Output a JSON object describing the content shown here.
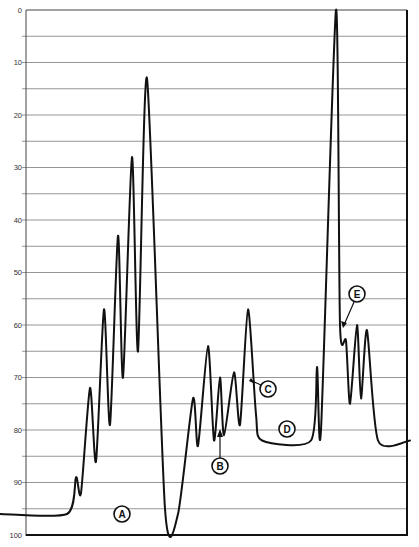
{
  "chart_data": {
    "type": "line",
    "title": "",
    "xlabel": "",
    "ylabel": "",
    "ylim": [
      0,
      100
    ],
    "y_inverted": true,
    "grid": true,
    "grid_step": 5,
    "y_ticks": [
      "0",
      "10",
      "20",
      "30",
      "40",
      "50",
      "60",
      "70",
      "80",
      "90",
      "100"
    ],
    "series": [
      {
        "name": "trace",
        "color": "#111111",
        "points": [
          {
            "x": 0,
            "y": 96
          },
          {
            "x": 67,
            "y": 96
          },
          {
            "x": 76,
            "y": 89
          },
          {
            "x": 81,
            "y": 92
          },
          {
            "x": 90,
            "y": 72
          },
          {
            "x": 96,
            "y": 86
          },
          {
            "x": 104,
            "y": 57
          },
          {
            "x": 110,
            "y": 79
          },
          {
            "x": 118,
            "y": 43
          },
          {
            "x": 123,
            "y": 70
          },
          {
            "x": 132,
            "y": 28
          },
          {
            "x": 138,
            "y": 65
          },
          {
            "x": 147,
            "y": 13
          },
          {
            "x": 165,
            "y": 95
          },
          {
            "x": 178,
            "y": 96
          },
          {
            "x": 193,
            "y": 74
          },
          {
            "x": 198,
            "y": 83
          },
          {
            "x": 208,
            "y": 64
          },
          {
            "x": 214,
            "y": 82
          },
          {
            "x": 220,
            "y": 70
          },
          {
            "x": 224,
            "y": 81
          },
          {
            "x": 234,
            "y": 69
          },
          {
            "x": 240,
            "y": 79
          },
          {
            "x": 248,
            "y": 57
          },
          {
            "x": 256,
            "y": 77
          },
          {
            "x": 262,
            "y": 82
          },
          {
            "x": 311,
            "y": 82
          },
          {
            "x": 317,
            "y": 68
          },
          {
            "x": 321,
            "y": 80
          },
          {
            "x": 336,
            "y": 0
          },
          {
            "x": 340,
            "y": 60
          },
          {
            "x": 346,
            "y": 63
          },
          {
            "x": 350,
            "y": 75
          },
          {
            "x": 357,
            "y": 60
          },
          {
            "x": 361,
            "y": 74
          },
          {
            "x": 367,
            "y": 61
          },
          {
            "x": 378,
            "y": 82
          },
          {
            "x": 410,
            "y": 82
          }
        ]
      }
    ],
    "annotations": [
      {
        "label": "A",
        "x": 122,
        "y": 96
      },
      {
        "label": "B",
        "x": 220,
        "y": 88,
        "arrow_to_y": 80
      },
      {
        "label": "C",
        "x": 268,
        "y": 73,
        "arrow_to_y": 71
      },
      {
        "label": "D",
        "x": 287,
        "y": 80
      },
      {
        "label": "E",
        "x": 357,
        "y": 56,
        "arrow_to_y": 63
      }
    ]
  },
  "axis": {
    "labels": [
      "0",
      "10",
      "20",
      "30",
      "40",
      "50",
      "60",
      "70",
      "80",
      "90",
      "100"
    ]
  },
  "callouts": {
    "a": "A",
    "b": "B",
    "c": "C",
    "d": "D",
    "e": "E"
  }
}
